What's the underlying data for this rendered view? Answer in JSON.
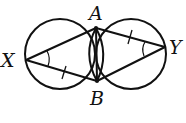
{
  "diagram": {
    "type": "geometry",
    "points": {
      "A": {
        "label": "A",
        "x": 96,
        "y": 28
      },
      "B": {
        "label": "B",
        "x": 97,
        "y": 81
      },
      "X": {
        "label": "X",
        "x": 26,
        "y": 60
      },
      "Y": {
        "label": "Y",
        "x": 165,
        "y": 47
      }
    },
    "circles": [
      {
        "name": "left-circle",
        "cx": 60,
        "cy": 54,
        "r": 35
      },
      {
        "name": "right-circle",
        "cx": 131,
        "cy": 54,
        "r": 35
      }
    ],
    "segments": [
      [
        "X",
        "A"
      ],
      [
        "X",
        "B"
      ],
      [
        "A",
        "Y"
      ],
      [
        "B",
        "Y"
      ],
      [
        "A",
        "B"
      ]
    ],
    "marks": {
      "equal_sides": [
        [
          "X",
          "B"
        ],
        [
          "A",
          "Y"
        ]
      ],
      "equal_angles": [
        "X",
        "Y"
      ]
    },
    "colors": {
      "stroke": "#111111",
      "background": "#ffffff"
    }
  }
}
